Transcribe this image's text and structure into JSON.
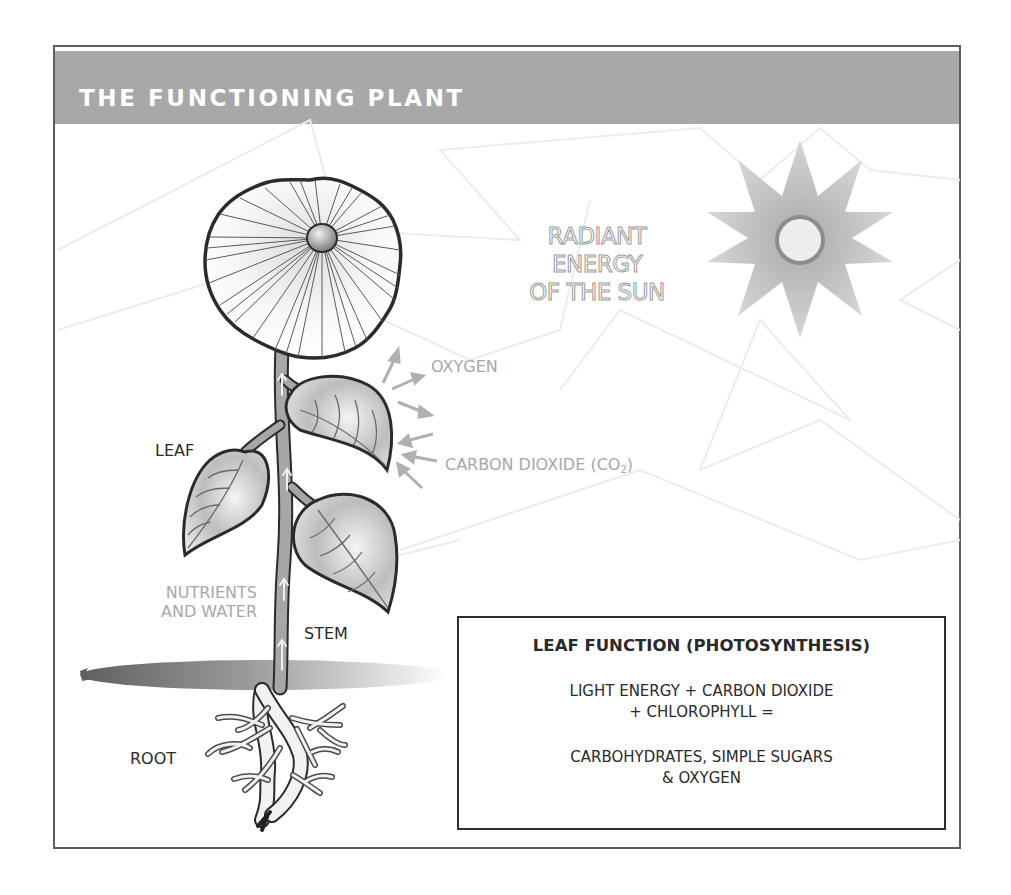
{
  "header": {
    "title": "THE FUNCTIONING PLANT",
    "background_color": "#a8a8a8",
    "text_color": "#ffffff"
  },
  "sun": {
    "label_lines": [
      "RADIANT",
      "ENERGY",
      "OF THE SUN"
    ]
  },
  "labels": {
    "oxygen": "OXYGEN",
    "carbon_dioxide": "CARBON DIOXIDE (CO",
    "carbon_dioxide_sub": "2",
    "carbon_dioxide_close": ")",
    "leaf": "LEAF",
    "nutrients_line1": "NUTRIENTS",
    "nutrients_line2": "AND WATER",
    "stem": "STEM",
    "root": "ROOT"
  },
  "leaf_function_box": {
    "title": "LEAF FUNCTION (PHOTOSYNTHESIS)",
    "equation_lines": [
      "LIGHT ENERGY + CARBON DIOXIDE",
      "+ CHLOROPHYLL ="
    ],
    "result_lines": [
      "CARBOHYDRATES, SIMPLE SUGARS",
      "& OXYGEN"
    ]
  },
  "colors": {
    "frame_border": "#5e5e5e",
    "label_dark": "#2a2a2a",
    "label_grey": "#a8a8a8",
    "sun_rays": "#bdbdbd",
    "sun_core_ring": "#8c8c8c",
    "sun_core": "#ededed"
  }
}
